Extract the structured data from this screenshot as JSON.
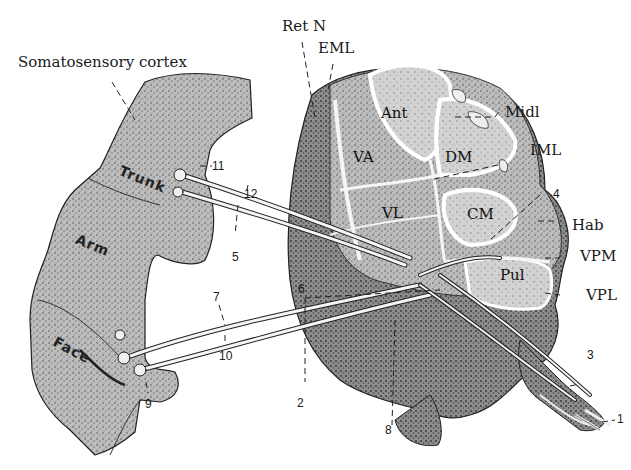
{
  "figure": {
    "colors": {
      "background": "#ffffff",
      "tissue_fill": "#b9b9b9",
      "tissue_dark": "#8a8a8a",
      "nucleus_fill": "#cfcfcf",
      "ink": "#1a1a1a",
      "fiber": "#f4f4f4"
    },
    "structures": {
      "cortex": "Somatosensory cortex",
      "thalamus": "Thalamus"
    },
    "cortex_regions": {
      "trunk": "Trunk",
      "arm": "Arm",
      "face": "Face"
    },
    "thalamic_nuclei": {
      "ant": "Ant",
      "va": "VA",
      "vl": "VL",
      "dm": "DM",
      "cm": "CM",
      "pul": "Pul"
    },
    "callout_labels": {
      "ret_n": "Ret N",
      "eml": "EML",
      "midl": "Midl",
      "iml": "IML",
      "hab": "Hab",
      "vpm": "VPM",
      "vpl": "VPL"
    },
    "numbers": {
      "n1": "1",
      "n2": "2",
      "n3": "3",
      "n4": "4",
      "n5": "5",
      "n6": "6",
      "n7": "7",
      "n8": "8",
      "n9": "9",
      "n10": "10",
      "n11": "11",
      "n12": "12"
    }
  }
}
